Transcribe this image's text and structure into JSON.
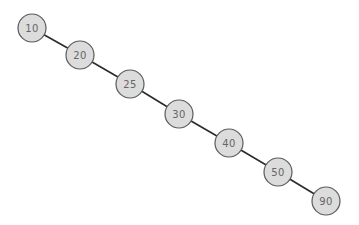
{
  "diagram": {
    "type": "binary-search-tree",
    "colors": {
      "node_fill": "#dcdcdc",
      "node_stroke": "#5a5a5a",
      "label": "#666666",
      "edge": "#2a2a2a",
      "background": "#ffffff"
    },
    "node_radius": 14,
    "nodes": [
      {
        "id": "n10",
        "label": "10",
        "x": 32,
        "y": 28
      },
      {
        "id": "n20",
        "label": "20",
        "x": 80,
        "y": 55
      },
      {
        "id": "n25",
        "label": "25",
        "x": 130,
        "y": 84
      },
      {
        "id": "n30",
        "label": "30",
        "x": 179,
        "y": 114
      },
      {
        "id": "n40",
        "label": "40",
        "x": 229,
        "y": 143
      },
      {
        "id": "n50",
        "label": "50",
        "x": 278,
        "y": 172
      },
      {
        "id": "n90",
        "label": "90",
        "x": 326,
        "y": 201
      }
    ],
    "edges": [
      {
        "from": "n10",
        "to": "n20"
      },
      {
        "from": "n20",
        "to": "n25"
      },
      {
        "from": "n25",
        "to": "n30"
      },
      {
        "from": "n30",
        "to": "n40"
      },
      {
        "from": "n40",
        "to": "n50"
      },
      {
        "from": "n50",
        "to": "n90"
      }
    ]
  }
}
